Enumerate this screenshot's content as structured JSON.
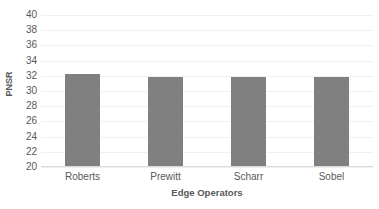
{
  "chart_data": {
    "type": "bar",
    "title": "",
    "subtitle": "",
    "xlabel": "Edge Operators",
    "ylabel": "PNSR",
    "categories": [
      "Roberts",
      "Prewitt",
      "Scharr",
      "Sobel"
    ],
    "values": [
      32.2,
      31.8,
      31.8,
      31.8
    ],
    "ylim": [
      20,
      40
    ],
    "ytick_step": 2,
    "ytick_labels": [
      "40",
      "38",
      "36",
      "34",
      "32",
      "30",
      "28",
      "26",
      "24",
      "22",
      "20"
    ],
    "ytick_values": [
      40,
      38,
      36,
      34,
      32,
      30,
      28,
      26,
      24,
      22,
      20
    ],
    "grid": true,
    "grid_axis": "y",
    "legend": false,
    "legend_position": "none",
    "series": [
      {
        "name": "PNSR",
        "values": [
          32.2,
          31.8,
          31.8,
          31.8
        ]
      }
    ]
  },
  "style": {
    "bar_color": "#808080",
    "grid_color": "#f0f0f0",
    "axis_color": "#d9d9d9",
    "text_color": "#595959",
    "background": "#ffffff"
  }
}
